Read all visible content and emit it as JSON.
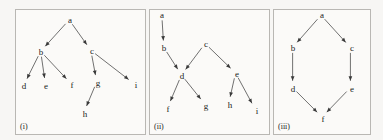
{
  "figure": {
    "background_color": "#f7f6f4",
    "panel_background_color": "#fbfaf8",
    "panel_border_color": "#b9b7b3",
    "edge_color": "#4a4a4a",
    "label_color": "#1a1a1a",
    "width": 383,
    "height": 140
  },
  "panels": [
    {
      "id": "panel-i",
      "caption": "(i)",
      "rect": {
        "x": 15,
        "y": 9,
        "w": 131,
        "h": 126
      },
      "nodes": [
        {
          "id": "a",
          "label": "a",
          "x": 54,
          "y": 10
        },
        {
          "id": "b",
          "label": "b",
          "x": 25,
          "y": 42
        },
        {
          "id": "c",
          "label": "c",
          "x": 76,
          "y": 41
        },
        {
          "id": "d",
          "label": "d",
          "x": 8,
          "y": 76
        },
        {
          "id": "e",
          "label": "e",
          "x": 30,
          "y": 76
        },
        {
          "id": "f",
          "label": "f",
          "x": 56,
          "y": 75
        },
        {
          "id": "g",
          "label": "g",
          "x": 82,
          "y": 73
        },
        {
          "id": "h",
          "label": "h",
          "x": 69,
          "y": 104
        },
        {
          "id": "i",
          "label": "i",
          "x": 120,
          "y": 75
        }
      ],
      "edges": [
        {
          "from": "a",
          "to": "b"
        },
        {
          "from": "a",
          "to": "c"
        },
        {
          "from": "b",
          "to": "d"
        },
        {
          "from": "b",
          "to": "e"
        },
        {
          "from": "b",
          "to": "f"
        },
        {
          "from": "c",
          "to": "g"
        },
        {
          "from": "c",
          "to": "i"
        },
        {
          "from": "g",
          "to": "h"
        }
      ]
    },
    {
      "id": "panel-ii",
      "caption": "(ii)",
      "rect": {
        "x": 149,
        "y": 9,
        "w": 121,
        "h": 126
      },
      "nodes": [
        {
          "id": "a",
          "label": "a",
          "x": 12,
          "y": 5
        },
        {
          "id": "b",
          "label": "b",
          "x": 14,
          "y": 38
        },
        {
          "id": "c",
          "label": "c",
          "x": 56,
          "y": 34
        },
        {
          "id": "d",
          "label": "d",
          "x": 32,
          "y": 66
        },
        {
          "id": "e",
          "label": "e",
          "x": 87,
          "y": 64
        },
        {
          "id": "f",
          "label": "f",
          "x": 18,
          "y": 99
        },
        {
          "id": "g",
          "label": "g",
          "x": 56,
          "y": 96
        },
        {
          "id": "h",
          "label": "h",
          "x": 80,
          "y": 95
        },
        {
          "id": "i",
          "label": "i",
          "x": 107,
          "y": 101
        }
      ],
      "edges": [
        {
          "from": "a",
          "to": "b"
        },
        {
          "from": "b",
          "to": "d"
        },
        {
          "from": "c",
          "to": "d"
        },
        {
          "from": "c",
          "to": "e"
        },
        {
          "from": "d",
          "to": "f"
        },
        {
          "from": "d",
          "to": "g"
        },
        {
          "from": "e",
          "to": "h"
        },
        {
          "from": "e",
          "to": "i"
        }
      ]
    },
    {
      "id": "panel-iii",
      "caption": "(iii)",
      "rect": {
        "x": 273,
        "y": 9,
        "w": 98,
        "h": 126
      },
      "nodes": [
        {
          "id": "a",
          "label": "a",
          "x": 48,
          "y": 5
        },
        {
          "id": "b",
          "label": "b",
          "x": 19,
          "y": 38
        },
        {
          "id": "c",
          "label": "c",
          "x": 78,
          "y": 38
        },
        {
          "id": "d",
          "label": "d",
          "x": 19,
          "y": 79
        },
        {
          "id": "e",
          "label": "e",
          "x": 78,
          "y": 79
        },
        {
          "id": "f",
          "label": "f",
          "x": 49,
          "y": 109
        }
      ],
      "edges": [
        {
          "from": "a",
          "to": "b"
        },
        {
          "from": "a",
          "to": "c"
        },
        {
          "from": "b",
          "to": "d"
        },
        {
          "from": "c",
          "to": "e"
        },
        {
          "from": "d",
          "to": "f"
        },
        {
          "from": "e",
          "to": "f"
        }
      ]
    }
  ]
}
